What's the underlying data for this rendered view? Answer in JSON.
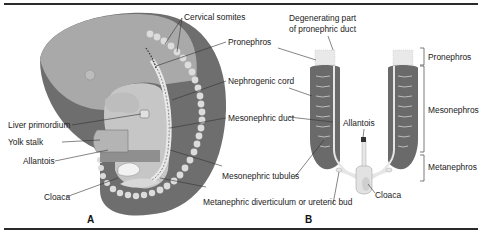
{
  "figure": {
    "panel_a": {
      "letter": "A",
      "labels": {
        "cervical_somites": "Cervical somites",
        "pronephros": "Pronephros",
        "nephrogenic_cord": "Nephrogenic cord",
        "mesonephric_duct": "Mesonephric duct",
        "liver_primordium": "Liver primordium",
        "yolk_stalk": "Yolk stalk",
        "allantois": "Allantois",
        "cloaca": "Cloaca",
        "mesonephric_tubules": "Mesonephric tubules",
        "metanephric_diverticulum": "Metanephric diverticulum or ureteric bud"
      }
    },
    "panel_b": {
      "letter": "B",
      "labels": {
        "degenerating_line1": "Degenerating part",
        "degenerating_line2": "of pronephric duct",
        "allantois": "Allantois",
        "cloaca": "Cloaca"
      },
      "brackets": {
        "pronephros": "Pronephros",
        "mesonephros": "Mesonephros",
        "metanephros": "Metanephros"
      }
    },
    "colors": {
      "embryo_body": "#a9a9a9",
      "embryo_dark": "#6e6e6e",
      "somite": "#d9d9d9",
      "gut": "#c4c4c4",
      "duct": "#e6e6e6",
      "kidney": "#6a6a6a",
      "rule": "#2a2a2a"
    }
  }
}
